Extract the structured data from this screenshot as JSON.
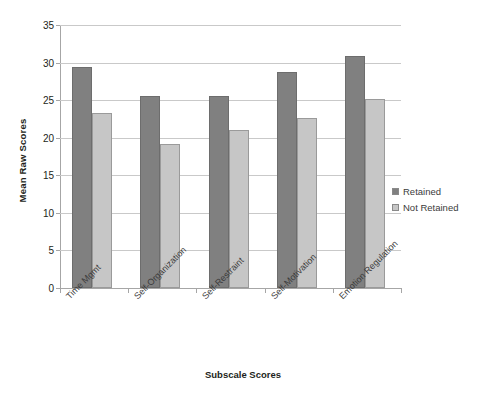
{
  "chart_data": {
    "type": "bar",
    "title": "",
    "xlabel": "Subscale Scores",
    "ylabel": "Mean Raw Scores",
    "categories": [
      "Time Mgmt",
      "Self-Organization",
      "Self-Restraint",
      "Self-Motivation",
      "Emotion Regulation"
    ],
    "series": [
      {
        "name": "Retained",
        "color": "#808080",
        "values": [
          29.4,
          25.6,
          25.6,
          28.7,
          30.9
        ]
      },
      {
        "name": "Not Retained",
        "color": "#c6c6c6",
        "values": [
          23.3,
          19.2,
          21.0,
          22.6,
          25.2
        ]
      }
    ],
    "ylim": [
      0,
      35
    ],
    "yticks": [
      0,
      5,
      10,
      15,
      20,
      25,
      30,
      35
    ],
    "ytick_labels": [
      "0",
      "5",
      "10",
      "15",
      "20",
      "25",
      "30",
      "35"
    ],
    "grid": true,
    "legend_position": "right"
  },
  "legend": {
    "items": [
      {
        "label": "Retained"
      },
      {
        "label": "Not Retained"
      }
    ]
  },
  "axes": {
    "y_title": "Mean Raw Scores",
    "x_title": "Subscale Scores"
  }
}
